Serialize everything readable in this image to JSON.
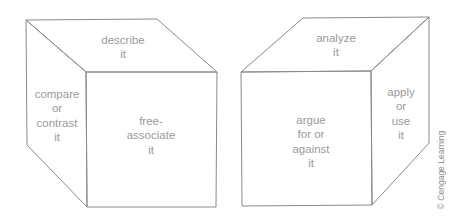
{
  "diagram": {
    "type": "cubing-strategy-illustration",
    "line_color": "#8a8a8a",
    "text_color": "#9a9a9a",
    "cubes": [
      {
        "id": "left-cube",
        "faces": {
          "top": {
            "lines": [
              "describe",
              "it"
            ]
          },
          "left_side": {
            "lines": [
              "compare",
              "or",
              "contrast",
              "it"
            ]
          },
          "front": {
            "lines": [
              "free-",
              "associate",
              "it"
            ]
          }
        }
      },
      {
        "id": "right-cube",
        "faces": {
          "top": {
            "lines": [
              "analyze",
              "it"
            ]
          },
          "front": {
            "lines": [
              "argue",
              "for or",
              "against",
              "it"
            ]
          },
          "right_side": {
            "lines": [
              "apply",
              "or",
              "use",
              "it"
            ]
          }
        }
      }
    ],
    "copyright": "© Cengage Learning"
  }
}
